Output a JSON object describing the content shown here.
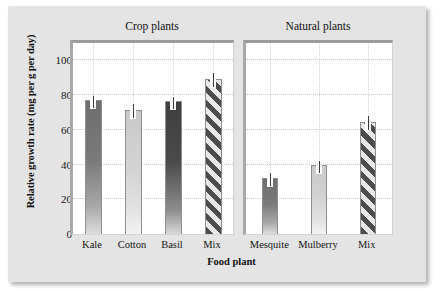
{
  "chart_data": {
    "type": "bar",
    "title": "",
    "xlabel": "Food plant",
    "ylabel": "Relative growth rate (mg per g per day)",
    "ylim": [
      0,
      110
    ],
    "yticks": [
      0,
      20,
      40,
      60,
      80,
      100
    ],
    "grid": "dotted",
    "legend": "none",
    "panels": [
      {
        "name": "Crop plants",
        "categories": [
          "Kale",
          "Cotton",
          "Basil",
          "Mix"
        ],
        "values": [
          77,
          71.5,
          76.5,
          89
        ],
        "errors": [
          2.5,
          3.5,
          2.5,
          3.5
        ],
        "fills": [
          "solid-medium-gray",
          "solid-light-gray",
          "solid-dark-gray",
          "diagonal-stripes"
        ]
      },
      {
        "name": "Natural plants",
        "categories": [
          "Mesquite",
          "Mulberry",
          "Mix"
        ],
        "values": [
          32.5,
          40,
          64.5
        ],
        "errors": [
          2.5,
          2.0,
          3.5
        ],
        "fills": [
          "solid-medium-gray",
          "solid-light-gray",
          "diagonal-stripes"
        ]
      }
    ]
  },
  "axes": {
    "y_title": "Relative growth rate (mg per g per day)",
    "x_title": "Food plant",
    "y_tick_labels": [
      "100",
      "80",
      "60",
      "40",
      "20",
      "0"
    ]
  },
  "panel_titles": {
    "crop": "Crop plants",
    "natural": "Natural plants"
  },
  "categories": {
    "crop": [
      "Kale",
      "Cotton",
      "Basil",
      "Mix"
    ],
    "natural": [
      "Mesquite",
      "Mulberry",
      "Mix"
    ]
  },
  "colors": {
    "figure_background": "#e4e4e4",
    "page_background": "#ffffff",
    "panel_background": "#ffffff",
    "frame": "#a8a8a8",
    "gridline": "#cfcfcf",
    "bar_medium": "#6e6e6e",
    "bar_light": "#cacaca",
    "bar_dark": "#3f3f3f",
    "stripe_dark": "#4c4c4c",
    "stripe_light": "#e8e8e8",
    "text": "#111111"
  }
}
